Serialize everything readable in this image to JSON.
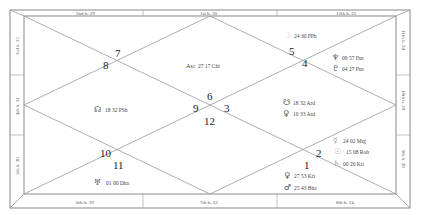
{
  "border_labels": {
    "top": [
      "2nd h. 29",
      "1st h. 30",
      "12th h. 22"
    ],
    "right": [
      "11th h. 24",
      "10th h. 29",
      "9th h. 28"
    ],
    "bottom": [
      "6th h. 39",
      "7th h. 32",
      "8th h. 24"
    ],
    "left": [
      "3rd h. 25",
      "4th h. 31",
      "5th h. 30"
    ]
  },
  "house_numbers": {
    "h7": "7",
    "h8": "8",
    "h5": "5",
    "h4": "4",
    "h6": "6",
    "h9": "9",
    "h3": "3",
    "h12": "12",
    "h10": "10",
    "h11": "11",
    "h2": "2",
    "h1": "1"
  },
  "planets": [
    {
      "id": "asc",
      "glyph": "Asc",
      "label": "27 17 Chi"
    },
    {
      "id": "moon",
      "glyph": "☽",
      "label": "24 30 PPh"
    },
    {
      "id": "neptune",
      "glyph": "♆",
      "label": "09 57 Pus"
    },
    {
      "id": "pluto",
      "glyph": "♇",
      "label": "04 27 Pus"
    },
    {
      "id": "rahu",
      "glyph": "☊",
      "label": "18 32 PSh"
    },
    {
      "id": "ketu",
      "glyph": "☋",
      "label": "18 32 Ard"
    },
    {
      "id": "jupiter",
      "glyph": "♀",
      "label": "10 33 Ard"
    },
    {
      "id": "mercury",
      "glyph": "☿",
      "label": "24 02 Mrg"
    },
    {
      "id": "sun",
      "glyph": "☉",
      "label": "15 08 Roh"
    },
    {
      "id": "saturn",
      "glyph": "♄",
      "label": "00 20 Kri"
    },
    {
      "id": "venus",
      "glyph": "♀",
      "label": "27 53 Kri"
    },
    {
      "id": "mars",
      "glyph": "♂",
      "label": "25 43 Bha"
    },
    {
      "id": "uranus",
      "glyph": "♅",
      "label": "01 00 Dha"
    }
  ],
  "colors": {
    "line": "#999999",
    "frame": "#888888",
    "text": "#333333"
  }
}
